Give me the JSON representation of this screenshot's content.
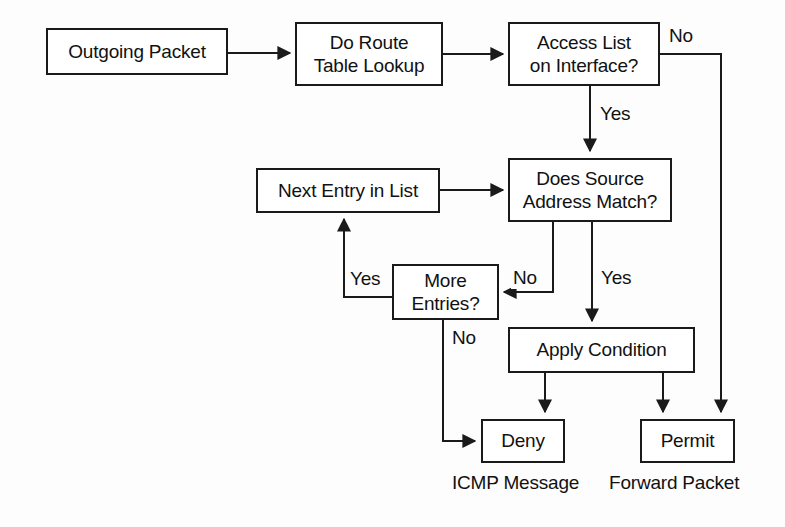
{
  "diagram": {
    "stroke_color": "#1a1a1a",
    "text_color": "#111111",
    "background_color": "#fdfdfd",
    "nodes": [
      {
        "id": "outgoing_packet",
        "label": "Outgoing Packet"
      },
      {
        "id": "route_lookup",
        "label": "Do Route\nTable Lookup"
      },
      {
        "id": "access_list",
        "label": "Access List\non Interface?"
      },
      {
        "id": "next_entry",
        "label": "Next Entry in List"
      },
      {
        "id": "source_match",
        "label": "Does Source\nAddress Match?"
      },
      {
        "id": "more_entries",
        "label": "More\nEntries?"
      },
      {
        "id": "apply_condition",
        "label": "Apply Condition"
      },
      {
        "id": "deny",
        "label": "Deny"
      },
      {
        "id": "permit",
        "label": "Permit"
      }
    ],
    "edge_labels": [
      {
        "id": "access_list_no",
        "label": "No"
      },
      {
        "id": "access_list_yes",
        "label": "Yes"
      },
      {
        "id": "source_match_no",
        "label": "No"
      },
      {
        "id": "source_match_yes",
        "label": "Yes"
      },
      {
        "id": "more_entries_yes",
        "label": "Yes"
      },
      {
        "id": "more_entries_no",
        "label": "No"
      }
    ],
    "captions": [
      {
        "id": "icmp_message",
        "label": "ICMP Message"
      },
      {
        "id": "forward_packet",
        "label": "Forward Packet"
      }
    ]
  }
}
